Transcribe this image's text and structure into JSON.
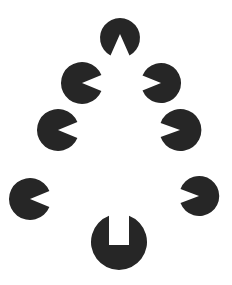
{
  "figure": {
    "width": 232,
    "height": 285,
    "background": "#ffffff",
    "fill": "#262626",
    "shapes": [
      {
        "id": "top-disc",
        "type": "disc-wedge",
        "cx": 120,
        "cy": 38,
        "r": 20,
        "notch": "up-wedge"
      },
      {
        "id": "left-disc-1",
        "type": "pacman",
        "cx": 82,
        "cy": 83,
        "r": 21,
        "mouth": "right"
      },
      {
        "id": "right-disc-1",
        "type": "pacman",
        "cx": 161,
        "cy": 83,
        "r": 20,
        "mouth": "left"
      },
      {
        "id": "left-disc-2",
        "type": "pacman",
        "cx": 58,
        "cy": 130,
        "r": 21,
        "mouth": "right"
      },
      {
        "id": "right-disc-2",
        "type": "pacman",
        "cx": 180,
        "cy": 130,
        "r": 21,
        "mouth": "left"
      },
      {
        "id": "left-disc-3",
        "type": "pacman",
        "cx": 30,
        "cy": 199,
        "r": 21,
        "mouth": "right"
      },
      {
        "id": "right-disc-3",
        "type": "pacman",
        "cx": 199,
        "cy": 196,
        "r": 20,
        "mouth": "left"
      },
      {
        "id": "bottom-disc",
        "type": "disc-slot",
        "cx": 119,
        "cy": 242,
        "r": 28,
        "notch": "top-slot"
      }
    ]
  }
}
